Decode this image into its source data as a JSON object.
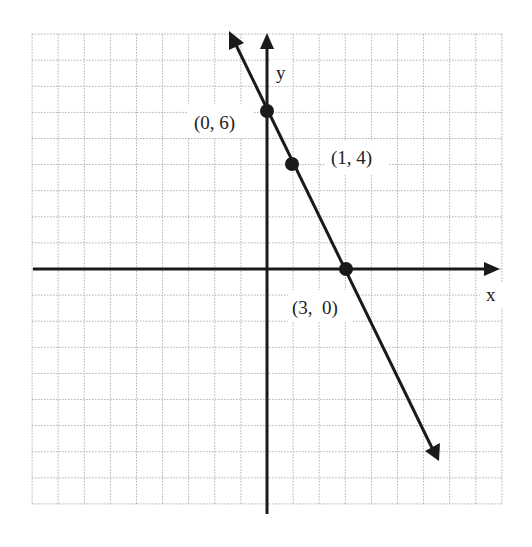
{
  "chart_data": {
    "type": "line",
    "title": "",
    "xlabel": "x",
    "ylabel": "y",
    "xlim": [
      -9,
      9
    ],
    "ylim": [
      -9,
      9
    ],
    "grid": true,
    "equation": "y = -2x + 6",
    "series": [
      {
        "name": "line",
        "x": [
          -1.5,
          6.5
        ],
        "y": [
          9,
          -7
        ]
      }
    ],
    "points": [
      {
        "x": 0,
        "y": 6,
        "label": "(0, 6)"
      },
      {
        "x": 1,
        "y": 4,
        "label": "(1, 4)"
      },
      {
        "x": 3,
        "y": 0,
        "label": "(3,  0)"
      }
    ],
    "colors": {
      "grid": "#b0b0b0",
      "axis": "#1a1a1a",
      "line": "#1a1a1a"
    }
  },
  "labels": {
    "x_axis": "x",
    "y_axis": "y",
    "p1": "(0, 6)",
    "p2": "(1, 4)",
    "p3": "(3,  0)"
  }
}
